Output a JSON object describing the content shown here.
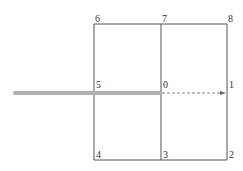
{
  "diagram": {
    "node_labels": {
      "n0": "0",
      "n1": "1",
      "n2": "2",
      "n3": "3",
      "n4": "4",
      "n5": "5",
      "n6": "6",
      "n7": "7",
      "n8": "8"
    },
    "colors": {
      "grid": "#555555",
      "bar": "#b0b0b0",
      "arrow": "#666666"
    }
  }
}
